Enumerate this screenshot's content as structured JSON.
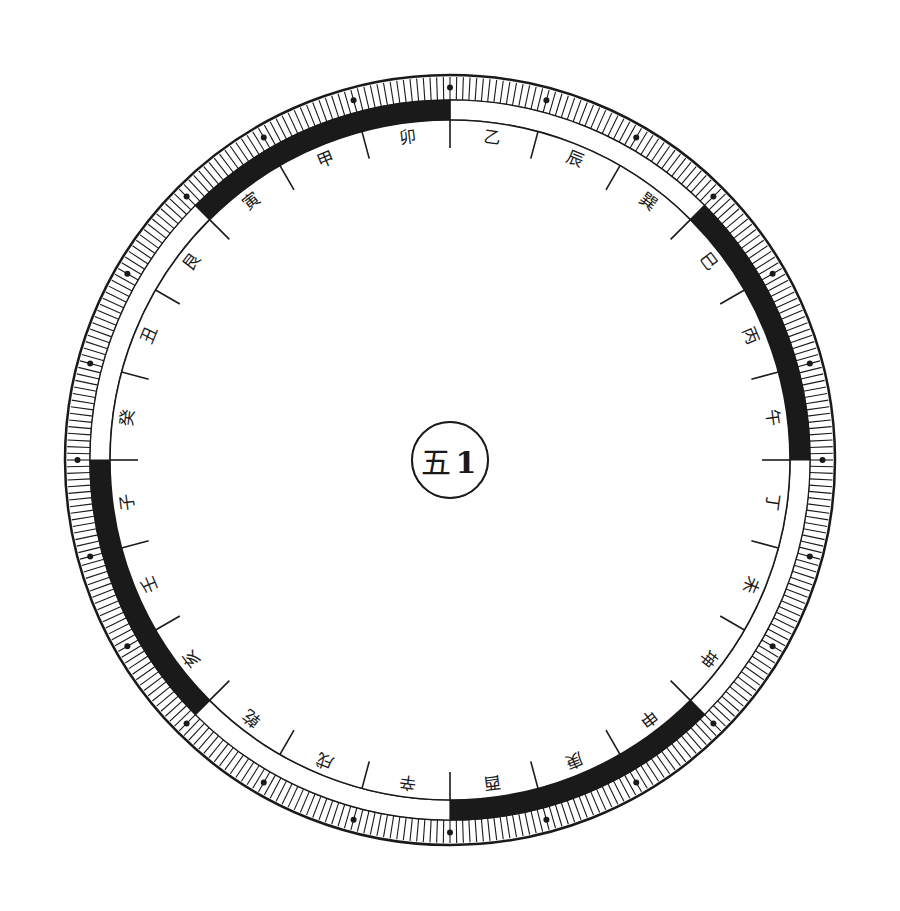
{
  "diagram": {
    "colors": {
      "ink": "#1a1a1a",
      "paper": "#ffffff"
    },
    "center": {
      "cx": 450,
      "cy": 460
    },
    "center_label": [
      "五",
      "1"
    ],
    "rings": [
      {
        "name": "trigram-ring",
        "r_inner": 38,
        "r_outer": 80,
        "font_size": 20,
        "start_angle": -112.5,
        "orient": "radial",
        "cells": [
          "巽",
          "離",
          "坤",
          "兌",
          "乾",
          "坎",
          "艮",
          "震"
        ]
      },
      {
        "name": "element-ring",
        "r_inner": 80,
        "r_outer": 118,
        "font_size": 17,
        "start_angle": -112.5,
        "orient": "radial",
        "cells": [
          "木風",
          "火天",
          "土地",
          "金澤",
          "天水",
          "水水",
          "山木",
          "地大"
        ]
      },
      {
        "name": "number-element-ring",
        "r_inner": 118,
        "r_outer": 158,
        "font_size": 17,
        "start_angle": -112.5,
        "orient": "radial",
        "cells": [
          "木三震",
          "日四木",
          "火九離",
          "坤二土",
          "兌七金",
          "乾六金",
          "坎一水",
          "艮八土"
        ]
      },
      {
        "name": "family-ring",
        "r_inner": 158,
        "r_outer": 198,
        "font_size": 17,
        "start_angle": -112.5,
        "orient": "radial",
        "cells": [
          "男長東",
          "女長東",
          "女中南",
          "母南西",
          "女少西",
          "父北西",
          "男中北",
          "男少北東"
        ]
      },
      {
        "name": "body-ring",
        "r_inner": 198,
        "r_outer": 240,
        "font_size": 16,
        "start_angle": -112.5,
        "orient": "radial",
        "cells": [
          "肝足毛髮筋",
          "膽股氣風",
          "目心大血炎",
          "胃脾腹皮膚",
          "口舌喉肺",
          "骨肺大腸頭",
          "耳腎血神經",
          "手鼻頸背神經"
        ]
      },
      {
        "name": "numeral-ring",
        "r_inner": 240,
        "r_outer": 283,
        "font_size": 22,
        "start_angle": -105,
        "orient": "radial",
        "cells": [
          "壹",
          "三",
          "9",
          "貳",
          "四",
          "5",
          "柒",
          "九",
          "7",
          "玖",
          "二",
          "3",
          "伍",
          "七",
          "2",
          "肆",
          "六",
          "6",
          "捌",
          "一",
          "4",
          "陸",
          "八",
          "8"
        ]
      },
      {
        "name": "phase-ring",
        "r_inner": 283,
        "r_outer": 312,
        "font_size": 17,
        "start_angle": -105,
        "orient": "radial",
        "cells": [
          "火",
          "土",
          "金",
          "木",
          "水",
          "火",
          "火",
          "土",
          "金",
          "木",
          "水",
          "火",
          "火",
          "土",
          "金",
          "木",
          "水",
          "火",
          "火",
          "土",
          "金",
          "木",
          "水",
          "木"
        ]
      },
      {
        "name": "stems-branches-ring",
        "r_inner": 312,
        "r_outer": 340,
        "font_size": 17,
        "start_angle": -105,
        "orient": "radial",
        "cells": [
          "卯",
          "乙",
          "辰",
          "巽",
          "巳",
          "丙",
          "午",
          "丁",
          "未",
          "坤",
          "申",
          "庚",
          "酉",
          "辛",
          "戌",
          "乾",
          "亥",
          "壬",
          "子",
          "癸",
          "丑",
          "艮",
          "寅",
          "甲"
        ]
      }
    ],
    "band": {
      "name": "black-white-band",
      "r_inner": 340,
      "r_outer": 360,
      "segments": 8,
      "start_angle": -90,
      "pattern": [
        "white",
        "black",
        "white",
        "black",
        "white",
        "black",
        "white",
        "black"
      ]
    },
    "ticks": {
      "name": "degree-tick-ring",
      "r_inner": 360,
      "r_outer": 385,
      "count": 360,
      "dot_every": 15
    }
  }
}
